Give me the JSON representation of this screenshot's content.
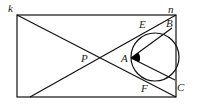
{
  "diagram": {
    "type": "geometry",
    "labels": {
      "k": "k",
      "n": "n",
      "P": "P",
      "A": "A",
      "B": "B",
      "C": "C",
      "E": "E",
      "F": "F"
    },
    "points": {
      "k": [
        17,
        15
      ],
      "n": [
        176,
        15
      ],
      "bottom_left_start": [
        30,
        97
      ],
      "bottom_right": [
        176,
        97
      ],
      "P": [
        98,
        58
      ],
      "A": [
        132,
        58
      ],
      "B": [
        172,
        28
      ],
      "C": [
        175,
        80
      ],
      "circle_center": [
        155,
        57
      ],
      "circle_radius": 24
    },
    "rectangle": {
      "x": 17,
      "y": 15,
      "width": 159,
      "height": 82
    },
    "angle_marker": {
      "vertex": "A",
      "between": [
        "B",
        "C"
      ],
      "filled": true
    },
    "colors": {
      "stroke": "#111111",
      "background": "#ffffff"
    }
  }
}
